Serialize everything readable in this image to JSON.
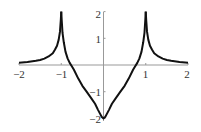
{
  "chart_data": {
    "type": "line",
    "title": "",
    "xlabel": "",
    "ylabel": "",
    "xlim": [
      -2,
      2
    ],
    "ylim": [
      -2,
      2
    ],
    "grid": false,
    "legend": null,
    "x_ticks": [
      -2,
      -1,
      1,
      2
    ],
    "x_tick_labels": [
      "−2",
      "−1",
      "1",
      "2"
    ],
    "y_ticks": [
      -2,
      -1,
      1,
      2
    ],
    "y_tick_labels": [
      "−2",
      "−1",
      "1",
      "2"
    ],
    "annotations": "Vertical asymptotes at x = ±1 (curve clipped at y = 2); cusp minimum y = −2 at x = 0; symmetric about y-axis",
    "series": [
      {
        "name": "f(x)",
        "color": "#111111",
        "x": [
          -2.0,
          -1.8,
          -1.6,
          -1.5,
          -1.4,
          -1.3,
          -1.2,
          -1.15,
          -1.1,
          -1.06,
          -1.03,
          -1.01,
          -1.0,
          -0.99,
          -0.97,
          -0.94,
          -0.9,
          -0.85,
          -0.8,
          -0.75,
          -0.7,
          -0.6,
          -0.5,
          -0.4,
          -0.3,
          -0.2,
          -0.13,
          -0.08,
          -0.04,
          0.0,
          0.04,
          0.08,
          0.13,
          0.2,
          0.3,
          0.4,
          0.5,
          0.6,
          0.7,
          0.75,
          0.8,
          0.85,
          0.9,
          0.94,
          0.97,
          0.99,
          1.0,
          1.01,
          1.03,
          1.06,
          1.1,
          1.15,
          1.2,
          1.3,
          1.4,
          1.5,
          1.6,
          1.8,
          2.0
        ],
        "y": [
          0.08,
          0.11,
          0.16,
          0.19,
          0.24,
          0.32,
          0.44,
          0.57,
          0.72,
          0.95,
          1.25,
          1.7,
          2.0,
          1.7,
          1.2,
          0.85,
          0.5,
          0.25,
          0.08,
          -0.05,
          -0.18,
          -0.5,
          -0.78,
          -1.0,
          -1.22,
          -1.45,
          -1.68,
          -1.83,
          -1.95,
          -2.0,
          -1.95,
          -1.83,
          -1.68,
          -1.45,
          -1.22,
          -1.0,
          -0.78,
          -0.5,
          -0.18,
          -0.05,
          0.08,
          0.25,
          0.5,
          0.85,
          1.2,
          1.7,
          2.0,
          1.7,
          1.25,
          0.95,
          0.72,
          0.57,
          0.44,
          0.32,
          0.24,
          0.19,
          0.16,
          0.11,
          0.08
        ]
      }
    ]
  },
  "axes": {
    "x_labels": [
      "−2",
      "−1",
      "1",
      "2"
    ],
    "y_labels": [
      "2",
      "1",
      "−1",
      "−2"
    ]
  }
}
